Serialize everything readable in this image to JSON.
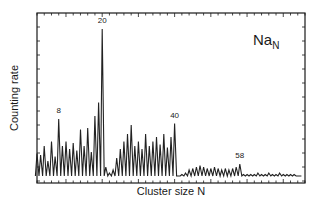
{
  "chart_data": {
    "type": "line",
    "title": "",
    "species_label": {
      "base": "Na",
      "subscript": "N"
    },
    "xlabel": "Cluster size N",
    "ylabel": "Counting rate",
    "xlim": [
      2,
      76
    ],
    "ylim": [
      0,
      1
    ],
    "grid": false,
    "legend": "none",
    "x_tick_labels_shown": false,
    "y_tick_labels_shown": false,
    "annotations": [
      {
        "text": "8",
        "x": 8
      },
      {
        "text": "20",
        "x": 20
      },
      {
        "text": "40",
        "x": 40
      },
      {
        "text": "58",
        "x": 58
      }
    ],
    "series": [
      {
        "name": "Na_N mass abundance",
        "x": [
          2,
          3,
          4,
          5,
          6,
          7,
          8,
          9,
          10,
          11,
          12,
          13,
          14,
          15,
          16,
          17,
          18,
          19,
          20,
          21,
          22,
          23,
          24,
          25,
          26,
          27,
          28,
          29,
          30,
          31,
          32,
          33,
          34,
          35,
          36,
          37,
          38,
          39,
          40,
          41,
          42,
          43,
          44,
          45,
          46,
          47,
          48,
          49,
          50,
          51,
          52,
          53,
          54,
          55,
          56,
          57,
          58,
          59,
          60,
          61,
          62,
          63,
          64,
          65,
          66,
          67,
          68,
          69,
          70,
          71,
          72,
          73,
          74,
          75
        ],
        "y": [
          0.17,
          0.16,
          0.22,
          0.12,
          0.25,
          0.15,
          0.4,
          0.22,
          0.25,
          0.2,
          0.24,
          0.19,
          0.33,
          0.22,
          0.34,
          0.18,
          0.42,
          0.51,
          1.0,
          0.08,
          0.04,
          0.06,
          0.14,
          0.2,
          0.25,
          0.3,
          0.36,
          0.22,
          0.25,
          0.2,
          0.3,
          0.22,
          0.25,
          0.28,
          0.23,
          0.3,
          0.21,
          0.28,
          0.37,
          0.02,
          0.03,
          0.04,
          0.06,
          0.07,
          0.08,
          0.09,
          0.08,
          0.07,
          0.07,
          0.08,
          0.07,
          0.06,
          0.07,
          0.06,
          0.07,
          0.08,
          0.1,
          0.03,
          0.03,
          0.03,
          0.03,
          0.04,
          0.03,
          0.03,
          0.04,
          0.03,
          0.03,
          0.04,
          0.03,
          0.03,
          0.03,
          0.03,
          0.02,
          0.02
        ]
      }
    ]
  }
}
